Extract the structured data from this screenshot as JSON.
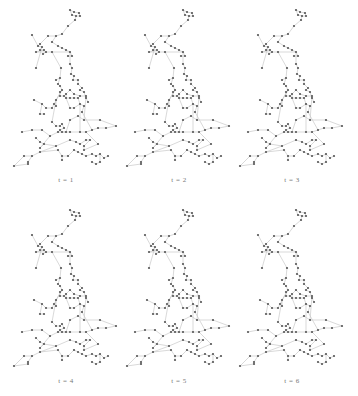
{
  "figure": {
    "panels": [
      {
        "label": "t = 1",
        "x": 0,
        "y": 0,
        "lx": 46,
        "ly": 176
      },
      {
        "label": "t = 2",
        "x": 113,
        "y": 0,
        "lx": 159,
        "ly": 176
      },
      {
        "label": "t = 3",
        "x": 226,
        "y": 0,
        "lx": 272,
        "ly": 176
      },
      {
        "label": "t = 4",
        "x": 0,
        "y": 200,
        "lx": 46,
        "ly": 377
      },
      {
        "label": "t = 5",
        "x": 113,
        "y": 200,
        "lx": 159,
        "ly": 377
      },
      {
        "label": "t = 6",
        "x": 226,
        "y": 200,
        "lx": 272,
        "ly": 377
      }
    ],
    "colors": {
      "edge": "#c8c8c8",
      "node": "#555555",
      "label": "#777777"
    },
    "nodes": [
      [
        70,
        10
      ],
      [
        74,
        12
      ],
      [
        79,
        13
      ],
      [
        72,
        15
      ],
      [
        76,
        16
      ],
      [
        80,
        16
      ],
      [
        75,
        20
      ],
      [
        68,
        26
      ],
      [
        62,
        34
      ],
      [
        56,
        36
      ],
      [
        48,
        36
      ],
      [
        40,
        44
      ],
      [
        38,
        46
      ],
      [
        42,
        47
      ],
      [
        40,
        50
      ],
      [
        44,
        50
      ],
      [
        36,
        52
      ],
      [
        46,
        52
      ],
      [
        43,
        54
      ],
      [
        52,
        42
      ],
      [
        32,
        35
      ],
      [
        58,
        46
      ],
      [
        62,
        48
      ],
      [
        66,
        50
      ],
      [
        70,
        52
      ],
      [
        72,
        56
      ],
      [
        68,
        56
      ],
      [
        52,
        52
      ],
      [
        36,
        68
      ],
      [
        61,
        68
      ],
      [
        60,
        78
      ],
      [
        58,
        84
      ],
      [
        60,
        86
      ],
      [
        56,
        80
      ],
      [
        70,
        64
      ],
      [
        72,
        68
      ],
      [
        71,
        74
      ],
      [
        74,
        76
      ],
      [
        73,
        80
      ],
      [
        78,
        80
      ],
      [
        78,
        84
      ],
      [
        82,
        88
      ],
      [
        80,
        90
      ],
      [
        84,
        92
      ],
      [
        86,
        98
      ],
      [
        88,
        102
      ],
      [
        62,
        90
      ],
      [
        60,
        92
      ],
      [
        60,
        96
      ],
      [
        64,
        96
      ],
      [
        66,
        94
      ],
      [
        70,
        90
      ],
      [
        74,
        94
      ],
      [
        80,
        96
      ],
      [
        86,
        96
      ],
      [
        56,
        100
      ],
      [
        56,
        106
      ],
      [
        66,
        98
      ],
      [
        70,
        98
      ],
      [
        74,
        98
      ],
      [
        78,
        98
      ],
      [
        80,
        104
      ],
      [
        74,
        108
      ],
      [
        70,
        108
      ],
      [
        84,
        106
      ],
      [
        82,
        112
      ],
      [
        34,
        100
      ],
      [
        42,
        104
      ],
      [
        46,
        108
      ],
      [
        52,
        108
      ],
      [
        54,
        104
      ],
      [
        40,
        114
      ],
      [
        44,
        114
      ],
      [
        52,
        122
      ],
      [
        56,
        126
      ],
      [
        60,
        126
      ],
      [
        62,
        124
      ],
      [
        64,
        128
      ],
      [
        60,
        130
      ],
      [
        62,
        132
      ],
      [
        66,
        132
      ],
      [
        70,
        120
      ],
      [
        78,
        116
      ],
      [
        84,
        120
      ],
      [
        22,
        132
      ],
      [
        32,
        130
      ],
      [
        42,
        130
      ],
      [
        50,
        136
      ],
      [
        58,
        132
      ],
      [
        70,
        132
      ],
      [
        80,
        132
      ],
      [
        86,
        132
      ],
      [
        92,
        130
      ],
      [
        98,
        128
      ],
      [
        106,
        128
      ],
      [
        116,
        126
      ],
      [
        100,
        120
      ],
      [
        36,
        138
      ],
      [
        40,
        142
      ],
      [
        44,
        144
      ],
      [
        40,
        148
      ],
      [
        56,
        146
      ],
      [
        70,
        140
      ],
      [
        76,
        142
      ],
      [
        80,
        144
      ],
      [
        86,
        140
      ],
      [
        90,
        140
      ],
      [
        84,
        146
      ],
      [
        84,
        150
      ],
      [
        98,
        144
      ],
      [
        24,
        156
      ],
      [
        32,
        156
      ],
      [
        40,
        152
      ],
      [
        58,
        150
      ],
      [
        62,
        156
      ],
      [
        68,
        156
      ],
      [
        74,
        150
      ],
      [
        78,
        152
      ],
      [
        82,
        154
      ],
      [
        86,
        156
      ],
      [
        92,
        154
      ],
      [
        96,
        156
      ],
      [
        100,
        154
      ],
      [
        104,
        158
      ],
      [
        108,
        156
      ],
      [
        14,
        166
      ],
      [
        28,
        164
      ],
      [
        28,
        162
      ],
      [
        62,
        160
      ],
      [
        92,
        162
      ],
      [
        96,
        164
      ],
      [
        100,
        162
      ]
    ],
    "edges": [
      [
        0,
        1
      ],
      [
        1,
        2
      ],
      [
        0,
        3
      ],
      [
        3,
        4
      ],
      [
        4,
        5
      ],
      [
        2,
        5
      ],
      [
        4,
        6
      ],
      [
        6,
        7
      ],
      [
        7,
        8
      ],
      [
        8,
        9
      ],
      [
        9,
        10
      ],
      [
        10,
        11
      ],
      [
        11,
        12
      ],
      [
        12,
        13
      ],
      [
        13,
        14
      ],
      [
        14,
        15
      ],
      [
        15,
        16
      ],
      [
        16,
        17
      ],
      [
        17,
        18
      ],
      [
        12,
        20
      ],
      [
        19,
        21
      ],
      [
        21,
        22
      ],
      [
        22,
        23
      ],
      [
        23,
        24
      ],
      [
        24,
        25
      ],
      [
        25,
        26
      ],
      [
        19,
        9
      ],
      [
        17,
        27
      ],
      [
        27,
        24
      ],
      [
        13,
        28
      ],
      [
        27,
        29
      ],
      [
        29,
        30
      ],
      [
        30,
        31
      ],
      [
        31,
        32
      ],
      [
        30,
        33
      ],
      [
        24,
        34
      ],
      [
        34,
        35
      ],
      [
        35,
        36
      ],
      [
        36,
        37
      ],
      [
        37,
        38
      ],
      [
        38,
        39
      ],
      [
        39,
        40
      ],
      [
        40,
        41
      ],
      [
        41,
        42
      ],
      [
        42,
        43
      ],
      [
        43,
        44
      ],
      [
        44,
        45
      ],
      [
        32,
        46
      ],
      [
        46,
        47
      ],
      [
        47,
        48
      ],
      [
        48,
        49
      ],
      [
        49,
        50
      ],
      [
        50,
        51
      ],
      [
        51,
        52
      ],
      [
        52,
        53
      ],
      [
        53,
        54
      ],
      [
        46,
        55
      ],
      [
        55,
        56
      ],
      [
        50,
        57
      ],
      [
        57,
        58
      ],
      [
        58,
        59
      ],
      [
        59,
        60
      ],
      [
        60,
        61
      ],
      [
        61,
        62
      ],
      [
        62,
        63
      ],
      [
        63,
        57
      ],
      [
        61,
        64
      ],
      [
        64,
        65
      ],
      [
        66,
        67
      ],
      [
        67,
        68
      ],
      [
        68,
        69
      ],
      [
        69,
        70
      ],
      [
        70,
        46
      ],
      [
        67,
        71
      ],
      [
        71,
        72
      ],
      [
        55,
        73
      ],
      [
        73,
        74
      ],
      [
        74,
        75
      ],
      [
        75,
        76
      ],
      [
        76,
        77
      ],
      [
        77,
        78
      ],
      [
        78,
        79
      ],
      [
        79,
        80
      ],
      [
        80,
        81
      ],
      [
        81,
        82
      ],
      [
        82,
        83
      ],
      [
        83,
        54
      ],
      [
        84,
        85
      ],
      [
        85,
        86
      ],
      [
        86,
        87
      ],
      [
        87,
        88
      ],
      [
        88,
        89
      ],
      [
        89,
        90
      ],
      [
        90,
        91
      ],
      [
        91,
        92
      ],
      [
        92,
        93
      ],
      [
        93,
        94
      ],
      [
        94,
        95
      ],
      [
        95,
        96
      ],
      [
        96,
        83
      ],
      [
        88,
        78
      ],
      [
        97,
        98
      ],
      [
        98,
        99
      ],
      [
        99,
        100
      ],
      [
        99,
        101
      ],
      [
        101,
        102
      ],
      [
        102,
        103
      ],
      [
        103,
        104
      ],
      [
        104,
        105
      ],
      [
        105,
        106
      ],
      [
        106,
        107
      ],
      [
        107,
        108
      ],
      [
        108,
        109
      ],
      [
        109,
        91
      ],
      [
        110,
        111
      ],
      [
        111,
        112
      ],
      [
        112,
        113
      ],
      [
        113,
        114
      ],
      [
        114,
        115
      ],
      [
        115,
        116
      ],
      [
        116,
        117
      ],
      [
        117,
        118
      ],
      [
        118,
        119
      ],
      [
        119,
        120
      ],
      [
        120,
        121
      ],
      [
        121,
        122
      ],
      [
        122,
        123
      ],
      [
        123,
        124
      ],
      [
        112,
        101
      ],
      [
        125,
        126
      ],
      [
        126,
        127
      ],
      [
        127,
        111
      ],
      [
        128,
        114
      ],
      [
        129,
        130
      ],
      [
        130,
        131
      ],
      [
        131,
        122
      ],
      [
        125,
        110
      ],
      [
        61,
        90
      ],
      [
        65,
        92
      ],
      [
        87,
        100
      ]
    ]
  }
}
